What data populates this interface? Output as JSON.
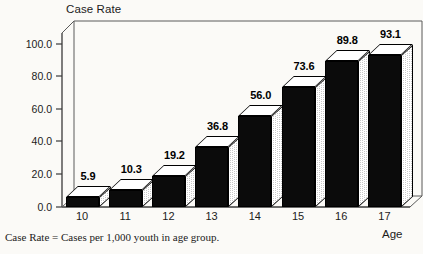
{
  "chart_data": {
    "type": "bar",
    "title": "Case Rate",
    "xlabel": "Age",
    "ylabel": "",
    "categories": [
      "10",
      "11",
      "12",
      "13",
      "14",
      "15",
      "16",
      "17"
    ],
    "values": [
      5.9,
      10.3,
      19.2,
      36.8,
      56.0,
      73.6,
      89.8,
      93.1
    ],
    "value_labels": [
      "5.9",
      "10.3",
      "19.2",
      "36.8",
      "56.0",
      "73.6",
      "89.8",
      "93.1"
    ],
    "ylim": [
      0.0,
      110.0
    ],
    "yticks": [
      0.0,
      20.0,
      40.0,
      60.0,
      80.0,
      100.0
    ],
    "ytick_labels": [
      "0.0",
      "20.0",
      "40.0",
      "60.0",
      "80.0",
      "100.0"
    ],
    "grid": false,
    "legend": "none",
    "style": "3d-bars",
    "colors": {
      "bar_front": "#0b0b0b",
      "bar_top": "#ffffff",
      "bar_side": "#c9c9c9",
      "axis": "#3a3a3a",
      "background": "#fbfaf7",
      "text": "#1b1b1b"
    },
    "footnote": "Case Rate = Cases per 1,000 youth in age group."
  }
}
